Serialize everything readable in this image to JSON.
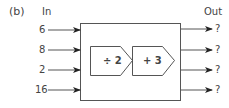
{
  "label": "(b)",
  "header": {
    "in": "In",
    "out": "Out"
  },
  "inputs": [
    "6",
    "8",
    "2",
    "16"
  ],
  "outputs": [
    "?",
    "?",
    "?",
    "?"
  ],
  "functions": [
    {
      "op": "÷ 2"
    },
    {
      "op": "+ 3"
    }
  ],
  "colors": {
    "stroke": "#555555",
    "arrow": "#222222",
    "text": "#444444"
  }
}
